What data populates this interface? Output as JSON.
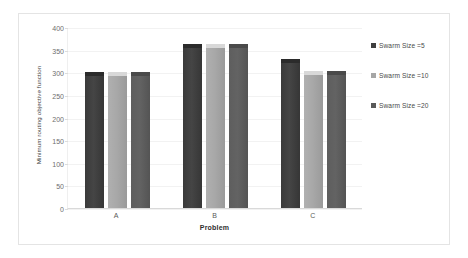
{
  "chart_data": {
    "type": "bar",
    "title": "",
    "categories": [
      "A",
      "B",
      "C"
    ],
    "series": [
      {
        "name": "Swarm Size =5",
        "values": [
          300,
          363,
          330
        ],
        "color": "#3F3F3F"
      },
      {
        "name": "Swarm Size =10",
        "values": [
          300,
          363,
          302
        ],
        "color": "#A6A6A6"
      },
      {
        "name": "Swarm Size =20",
        "values": [
          300,
          363,
          302
        ],
        "color": "#595959"
      }
    ],
    "xlabel": "Problem",
    "ylabel": "Minimum routing objective function",
    "ylim": [
      0,
      400
    ],
    "ytick_step": 50,
    "yticks": [
      "400",
      "350",
      "300",
      "250",
      "200",
      "150",
      "100",
      "50",
      "0"
    ],
    "grid": true,
    "legend_position": "right"
  },
  "legend": {
    "items": [
      {
        "label": "Swarm Size =5"
      },
      {
        "label": "Swarm Size =10"
      },
      {
        "label": "Swarm Size =20"
      }
    ]
  }
}
